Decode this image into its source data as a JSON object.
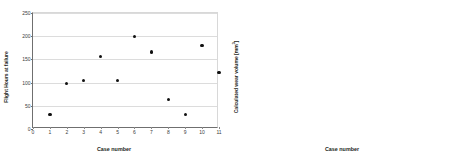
{
  "figure": {
    "background": "#ffffff",
    "marker_color": "#111111",
    "grid_color": "#dcdcdc",
    "axis_color": "#6f6f6f"
  },
  "chart_data": [
    {
      "id": "left",
      "type": "scatter",
      "title": "",
      "xlabel": "Case number",
      "ylabel": "Flight Hours at failure",
      "xlim": [
        0,
        11
      ],
      "ylim": [
        0,
        250
      ],
      "grid": true,
      "legend": "none",
      "xticks": [
        0,
        1,
        2,
        3,
        4,
        5,
        6,
        7,
        8,
        9,
        10,
        11
      ],
      "xticklabels": [
        "0",
        "1",
        "2",
        "3",
        "4",
        "5",
        "6",
        "7",
        "8",
        "9",
        "10",
        "11"
      ],
      "yticks": [
        0,
        50,
        100,
        150,
        200,
        250
      ],
      "yticklabels": [
        "0",
        "50",
        "100",
        "150",
        "200",
        "250"
      ],
      "x": [
        1,
        2,
        3,
        4,
        5,
        6,
        7,
        8,
        9,
        10,
        11
      ],
      "values": [
        32,
        98,
        104,
        156,
        104,
        199,
        166,
        64,
        31,
        180,
        122
      ],
      "reference_lines": []
    },
    {
      "id": "right",
      "type": "scatter",
      "title": "",
      "xlabel": "Case number",
      "ylabel_text": "Calculated wear volume [mm",
      "ylabel_sup": "3",
      "ylabel_tail": "]",
      "ylabel": "Calculated wear volume [mm3]",
      "xlim": [
        0,
        11.6
      ],
      "ylim": [
        0,
        60
      ],
      "grid": true,
      "legend": "none",
      "xticks": [
        1,
        2,
        3,
        4,
        5,
        6,
        7,
        8,
        9,
        10,
        11
      ],
      "xticklabels": [
        "1",
        "2",
        "3",
        "4",
        "5",
        "6",
        "7",
        "8",
        "9",
        "10",
        "11"
      ],
      "yticks": [
        0,
        10,
        20,
        30,
        40,
        50,
        60
      ],
      "yticklabels": [
        "0",
        "10",
        "20",
        "30",
        "40",
        "50",
        "60"
      ],
      "zero_label": "0",
      "x": [
        1,
        2,
        3,
        4,
        5,
        6,
        7,
        8,
        9,
        10,
        11
      ],
      "values": [
        6.2,
        18.0,
        28.2,
        30.2,
        27.3,
        47.7,
        47.9,
        26.9,
        28.1,
        51.0,
        32.2
      ],
      "reference_lines": [
        {
          "name": "overall-mean",
          "style": "solid",
          "y": 28.6,
          "x_start": 0,
          "x_end": 11.6
        },
        {
          "name": "subgroup-mean",
          "style": "dashed",
          "y": 49.2,
          "x_start": 5.4,
          "x_end": 10.5
        }
      ]
    }
  ]
}
